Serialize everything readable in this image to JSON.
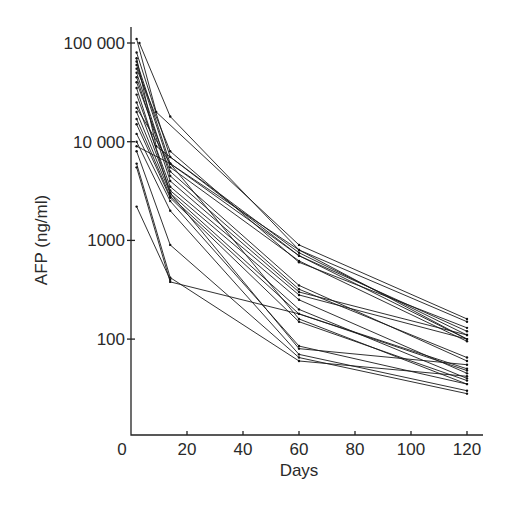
{
  "chart_data": {
    "type": "line",
    "title": "",
    "xlabel": "Days",
    "ylabel": "AFP (ng/ml)",
    "yscale": "log",
    "xlim": [
      0,
      122
    ],
    "ylim": [
      10,
      130000
    ],
    "grid": false,
    "legend": null,
    "x_ticks": [
      0,
      20,
      40,
      60,
      80,
      100,
      120
    ],
    "x_tick_labels": [
      "0",
      "20",
      "40",
      "60",
      "80",
      "100",
      "120"
    ],
    "y_ticks": [
      100,
      1000,
      10000,
      100000
    ],
    "y_tick_labels": [
      "100",
      "1000",
      "10 000",
      "100 000"
    ],
    "series": [
      {
        "name": "patient 1",
        "x": [
          2,
          9,
          60,
          120
        ],
        "y": [
          110000,
          20000,
          900,
          160
        ]
      },
      {
        "name": "patient 2",
        "x": [
          3,
          14,
          60,
          120
        ],
        "y": [
          100000,
          18000,
          800,
          150
        ]
      },
      {
        "name": "patient 3",
        "x": [
          2,
          14,
          60,
          120
        ],
        "y": [
          80000,
          7000,
          750,
          110
        ]
      },
      {
        "name": "patient 4",
        "x": [
          2,
          14,
          60,
          120
        ],
        "y": [
          65000,
          6000,
          700,
          100
        ]
      },
      {
        "name": "patient 5",
        "x": [
          2,
          14,
          60,
          120
        ],
        "y": [
          60000,
          5500,
          620,
          95
        ]
      },
      {
        "name": "patient 6",
        "x": [
          2,
          14,
          60,
          120
        ],
        "y": [
          55000,
          8000,
          600,
          130
        ]
      },
      {
        "name": "patient 7",
        "x": [
          2,
          14,
          60,
          120
        ],
        "y": [
          50000,
          4500,
          320,
          65
        ]
      },
      {
        "name": "patient 8",
        "x": [
          2,
          14,
          60,
          120
        ],
        "y": [
          45000,
          4000,
          300,
          110
        ]
      },
      {
        "name": "patient 9",
        "x": [
          2,
          14,
          60,
          120
        ],
        "y": [
          30000,
          3500,
          280,
          100
        ]
      },
      {
        "name": "patient 10",
        "x": [
          2,
          14,
          60,
          120
        ],
        "y": [
          25000,
          3200,
          250,
          45
        ]
      },
      {
        "name": "patient 11",
        "x": [
          2,
          14,
          60,
          120
        ],
        "y": [
          20000,
          3000,
          200,
          40
        ]
      },
      {
        "name": "patient 12",
        "x": [
          2,
          14,
          60,
          120
        ],
        "y": [
          17000,
          2800,
          180,
          50
        ]
      },
      {
        "name": "patient 13",
        "x": [
          2,
          14,
          60,
          120
        ],
        "y": [
          15000,
          2700,
          150,
          38
        ]
      },
      {
        "name": "patient 14",
        "x": [
          2,
          14,
          60,
          120
        ],
        "y": [
          12000,
          2500,
          85,
          35
        ]
      },
      {
        "name": "patient 15",
        "x": [
          2,
          14,
          60,
          120
        ],
        "y": [
          10000,
          2000,
          70,
          30
        ]
      },
      {
        "name": "patient 16",
        "x": [
          2,
          14,
          60,
          120
        ],
        "y": [
          8000,
          900,
          65,
          28
        ]
      },
      {
        "name": "patient 17",
        "x": [
          2,
          14,
          60,
          120
        ],
        "y": [
          6000,
          420,
          60,
          42
        ]
      },
      {
        "name": "patient 18",
        "x": [
          2,
          14,
          60,
          120
        ],
        "y": [
          5500,
          380,
          180,
          48
        ]
      },
      {
        "name": "patient 19",
        "x": [
          2,
          14
        ],
        "y": [
          2200,
          400
        ]
      },
      {
        "name": "patient 20",
        "x": [
          2,
          14,
          60,
          120
        ],
        "y": [
          9000,
          6000,
          800,
          100
        ]
      },
      {
        "name": "patient 21",
        "x": [
          2,
          9,
          60,
          120
        ],
        "y": [
          70000,
          9000,
          700,
          120
        ]
      },
      {
        "name": "patient 22",
        "x": [
          2,
          14,
          60,
          120
        ],
        "y": [
          40000,
          5000,
          350,
          60
        ]
      },
      {
        "name": "patient 23",
        "x": [
          2,
          14,
          60,
          120
        ],
        "y": [
          35000,
          3000,
          80,
          55
        ]
      },
      {
        "name": "patient 24",
        "x": [
          2,
          14,
          60,
          120
        ],
        "y": [
          22000,
          6000,
          160,
          35
        ]
      }
    ]
  },
  "layout": {
    "plot_left": 131,
    "plot_right": 467,
    "x_min": 0,
    "x_max": 120,
    "y_top_px": 43,
    "y_top_value": 100000,
    "px_per_decade": 98.7,
    "baseline_y": 435,
    "axis_top_y": 27,
    "axis_right_x": 483
  }
}
